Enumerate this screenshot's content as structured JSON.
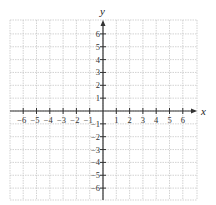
{
  "chart_data": {
    "type": "scatter",
    "title": "",
    "xlabel": "x",
    "ylabel": "y",
    "xlim": [
      -7,
      7
    ],
    "ylim": [
      -7,
      7
    ],
    "grid": true,
    "grid_style": "dotted",
    "x_ticks": [
      -6,
      -5,
      -4,
      -3,
      -2,
      -1,
      1,
      2,
      3,
      4,
      5,
      6
    ],
    "y_ticks": [
      -6,
      -5,
      -4,
      -3,
      -2,
      -1,
      1,
      2,
      3,
      4,
      5,
      6
    ],
    "x_tick_labels": [
      "−6",
      "−5",
      "−4",
      "−3",
      "−2",
      "−1",
      "1",
      "2",
      "3",
      "4",
      "5",
      "6"
    ],
    "y_tick_labels": [
      "−6",
      "−5",
      "−4",
      "−3",
      "−2",
      "−1",
      "1",
      "2",
      "3",
      "4",
      "5",
      "6"
    ],
    "series": [],
    "legend": null
  },
  "layout": {
    "grid_left": 10,
    "grid_right": 197,
    "grid_top": 20,
    "grid_bottom": 200,
    "origin_x": 103,
    "origin_y": 111,
    "unit_x": 13.3,
    "unit_y": 12.85
  },
  "colors": {
    "grid": "#c8c8c8",
    "axis": "#333333",
    "text": "#333333"
  }
}
